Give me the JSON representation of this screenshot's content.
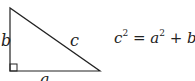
{
  "diagram": {
    "labels": {
      "side_a": "a",
      "side_b": "b",
      "side_c": "c"
    },
    "equation": {
      "lhs_var": "c",
      "lhs_exp": "2",
      "eq_sign": "=",
      "term1_var": "a",
      "term1_exp": "2",
      "plus": "+",
      "term2_var": "b",
      "term2_exp": "2"
    },
    "colors": {
      "stroke": "#222222",
      "background": "#ffffff"
    }
  }
}
